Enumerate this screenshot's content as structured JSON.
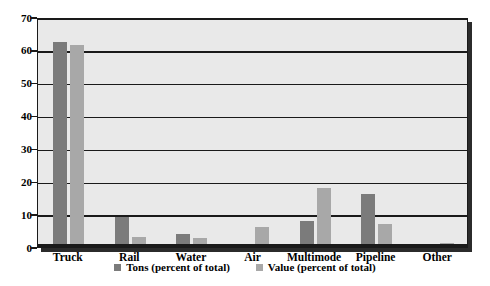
{
  "chart_data": {
    "type": "bar",
    "title": "",
    "subtitle": "",
    "xlabel": "",
    "ylabel": "",
    "ylim": [
      0,
      70
    ],
    "ytick_step": 10,
    "yticks": [
      "70",
      "60",
      "50",
      "40",
      "30",
      "20",
      "10",
      "0"
    ],
    "grid": true,
    "grid_axis": "y",
    "legend_position": "bottom-center",
    "categories": [
      "Truck",
      "Rail",
      "Water",
      "Air",
      "Multimode",
      "Pipeline",
      "Other"
    ],
    "series": [
      {
        "name": "Tons (percent of total)",
        "color": "#7b7b7b",
        "values": [
          62.5,
          9,
          4,
          1,
          8,
          16,
          0.8
        ]
      },
      {
        "name": "Value (percent of total)",
        "color": "#a8a8a8",
        "values": [
          61.5,
          3,
          2.8,
          6,
          18,
          7,
          1.2
        ]
      }
    ]
  },
  "legend": {
    "entries": [
      {
        "label": "Tons (percent of total)",
        "swatch": "tons-swatch"
      },
      {
        "label": "Value (percent of total)",
        "swatch": "value-swatch"
      }
    ]
  },
  "colors": {
    "tons": "#7b7b7b",
    "value": "#a8a8a8",
    "plot_background": "#e9e9e9",
    "axis": "#1a1a1a",
    "page_background": "#ffffff"
  }
}
